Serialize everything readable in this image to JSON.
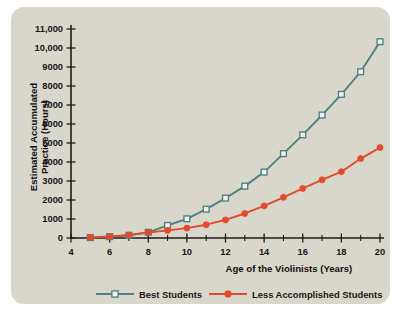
{
  "chart_data": {
    "type": "line",
    "title": "",
    "xlabel": "Age of the Violinists (Years)",
    "ylabel": "Estimated Accumulated Practice (Hours)",
    "ylabel_line1": "Estimated Accumulated",
    "ylabel_line2": "Practice (Hours)",
    "x": [
      5,
      6,
      7,
      8,
      9,
      10,
      11,
      12,
      13,
      14,
      15,
      16,
      17,
      18,
      19,
      20
    ],
    "xlim": [
      4,
      20
    ],
    "ylim": [
      0,
      11000
    ],
    "xticks": [
      4,
      6,
      8,
      10,
      12,
      14,
      16,
      18,
      20
    ],
    "xticklabels": [
      "4",
      "6",
      "8",
      "10",
      "12",
      "14",
      "16",
      "18",
      "20"
    ],
    "xticks_minor": [
      5,
      7,
      9,
      11,
      13,
      15,
      17,
      19
    ],
    "yticks": [
      0,
      1000,
      2000,
      3000,
      4000,
      5000,
      6000,
      7000,
      8000,
      9000,
      10000,
      11000
    ],
    "yticklabels": [
      "0",
      "1000",
      "2000",
      "3000",
      "4000",
      "5000",
      "6000",
      "7000",
      "8000",
      "9000",
      "10,000",
      "11,000"
    ],
    "grid": false,
    "legend_position": "bottom",
    "series": [
      {
        "name": "Best Students",
        "color": "#4e8183",
        "marker": "square-open",
        "marker_fill": "#f2f0ea",
        "values": [
          25,
          70,
          140,
          300,
          660,
          1010,
          1520,
          2100,
          2730,
          3470,
          4440,
          5430,
          6470,
          7560,
          8750,
          10330
        ]
      },
      {
        "name": "Less Accomplished Students",
        "color": "#e24a2c",
        "marker": "circle-filled",
        "marker_fill": "#e24a2c",
        "values": [
          25,
          80,
          160,
          290,
          400,
          520,
          700,
          950,
          1290,
          1690,
          2140,
          2610,
          3060,
          3490,
          4180,
          4760
        ]
      }
    ]
  },
  "legend": {
    "items": [
      {
        "label": "Best Students",
        "color": "#4e8183",
        "marker": "square-open"
      },
      {
        "label": "Less Accomplished Students",
        "color": "#e24a2c",
        "marker": "circle-filled"
      }
    ]
  },
  "colors": {
    "card_background": "#d9d6cc",
    "page_background": "#ffffff",
    "axis": "#1b1b18",
    "best_students": "#4e8183",
    "less_accomplished": "#e24a2c"
  }
}
